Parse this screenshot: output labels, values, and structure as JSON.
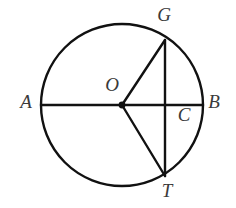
{
  "figure": {
    "type": "geometry-diagram",
    "background_color": "#ffffff",
    "stroke_color": "#111111",
    "label_color": "#3a3a3a"
  },
  "circle": {
    "name": "circle-O",
    "center_x": 122,
    "center_y": 105,
    "radius": 81
  },
  "points": [
    {
      "id": "A",
      "label": "A",
      "x": 41,
      "y": 105,
      "label_x": 26,
      "label_y": 104,
      "on": "circle"
    },
    {
      "id": "B",
      "label": "B",
      "x": 203,
      "y": 105,
      "label_x": 214,
      "label_y": 104,
      "on": "circle"
    },
    {
      "id": "G",
      "label": "G",
      "x": 165,
      "y": 40,
      "label_x": 164,
      "label_y": 17,
      "on": "circle"
    },
    {
      "id": "T",
      "label": "T",
      "x": 165,
      "y": 176,
      "label_x": 167,
      "label_y": 193,
      "on": "circle"
    },
    {
      "id": "O",
      "label": "O",
      "x": 122,
      "y": 105,
      "label_x": 112,
      "label_y": 87,
      "on": "center"
    },
    {
      "id": "C",
      "label": "C",
      "x": 165,
      "y": 105,
      "label_x": 184,
      "label_y": 117,
      "on": "intersection"
    }
  ],
  "segments": [
    {
      "id": "AB",
      "name": "diameter-ab",
      "x1": 41,
      "y1": 105,
      "x2": 203,
      "y2": 105
    },
    {
      "id": "GT",
      "name": "chord-gt",
      "x1": 165,
      "y1": 40,
      "x2": 165,
      "y2": 176
    },
    {
      "id": "OG",
      "name": "radius-og",
      "x1": 122,
      "y1": 105,
      "x2": 165,
      "y2": 40
    },
    {
      "id": "OT",
      "name": "radius-ot",
      "x1": 122,
      "y1": 105,
      "x2": 165,
      "y2": 176
    }
  ],
  "center_dot": {
    "x": 122,
    "y": 105,
    "radius": 3.4
  }
}
